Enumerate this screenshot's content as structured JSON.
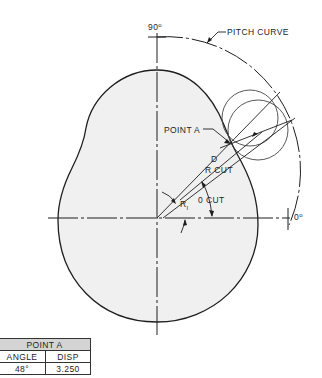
{
  "labels": {
    "angle_90": "90",
    "angle_0": "0",
    "degree": "o",
    "pitch_curve": "PITCH CURVE",
    "point_a": "POINT A",
    "d": "D",
    "r_cut": "R CUT",
    "r1_main": "R",
    "r1_sub": "I",
    "theta_cut": "0 CUT"
  },
  "table": {
    "title": "POINT A",
    "headers": [
      "ANGLE",
      "DISP"
    ],
    "rows": [
      {
        "angle": "48°",
        "disp": "3.250"
      }
    ]
  },
  "colors": {
    "line": "#1e1e1e",
    "cam_fill": "#f0f0f0",
    "table_header_fill": "#d4d4d4"
  }
}
